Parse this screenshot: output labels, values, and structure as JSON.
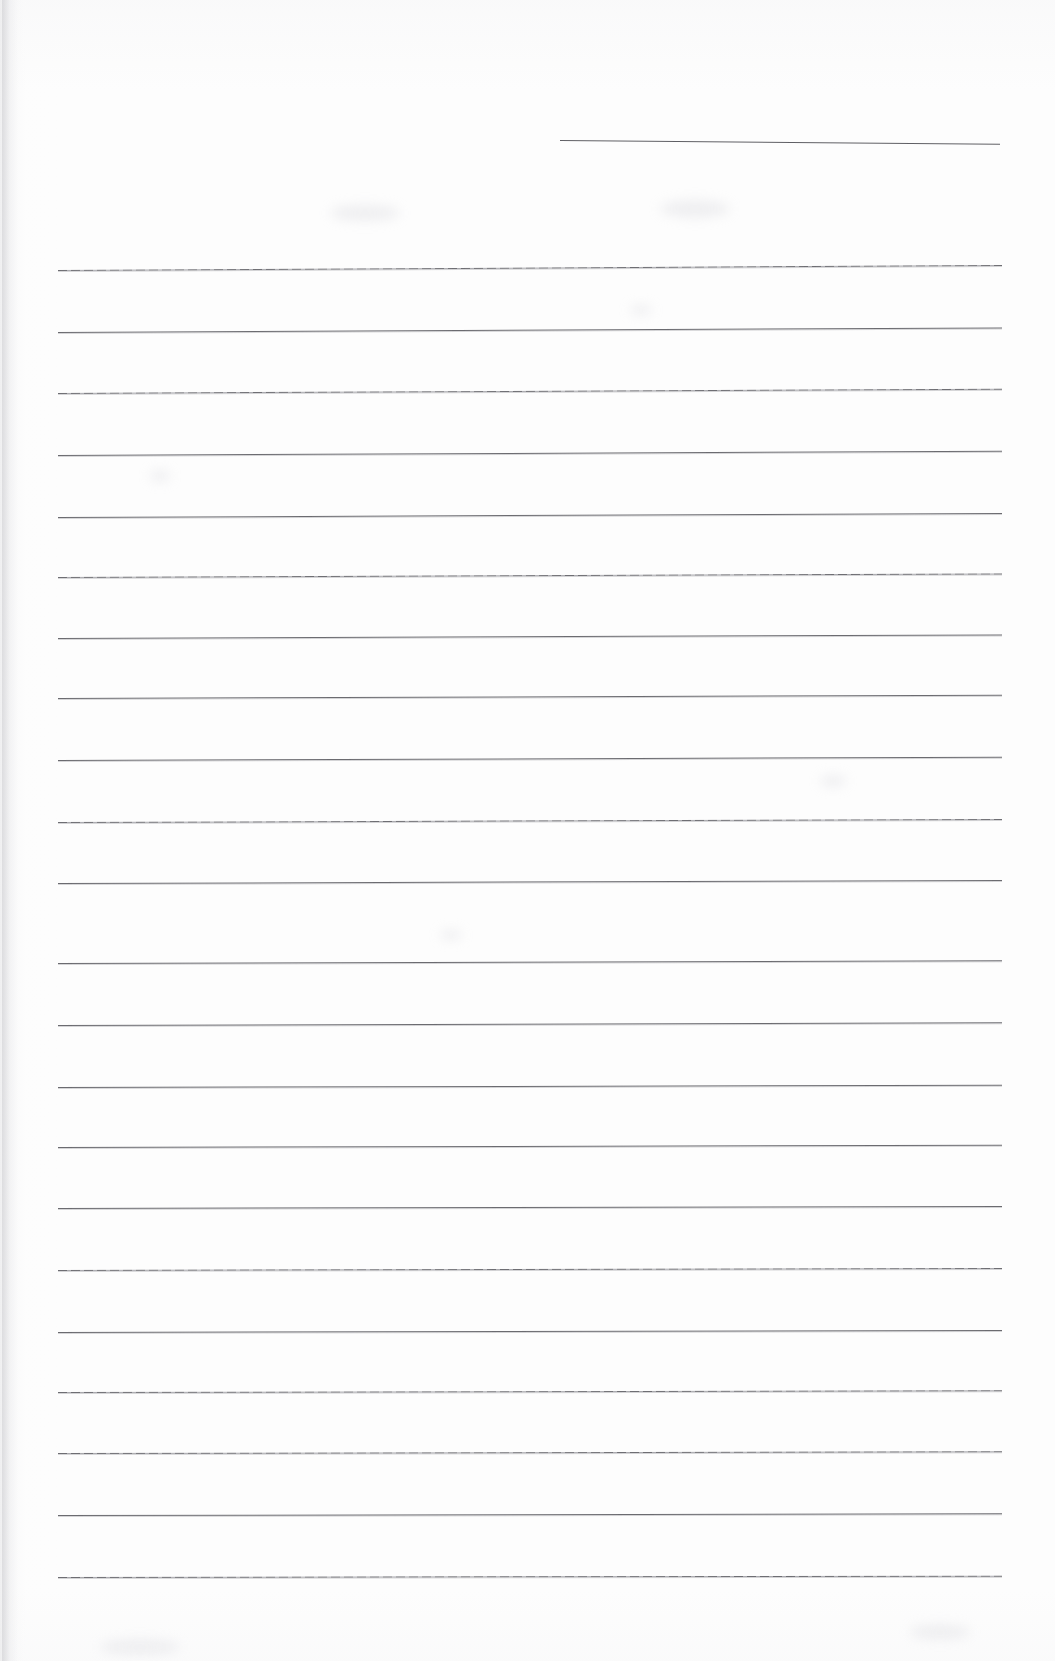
{
  "document": {
    "kind": "scanned-lined-page",
    "title": "Blank Ruled Page",
    "page_width": 1055,
    "page_height": 1661,
    "background_color": "#fdfdfd",
    "line_color": "#6b6b70",
    "text_content": "",
    "visible_text": []
  },
  "header_rule": {
    "name": "top-short-rule",
    "x": 560,
    "y": 140,
    "width": 440,
    "rotation_deg": 0.5,
    "color": "#5f5f64"
  },
  "ruling": {
    "left_margin": 58,
    "right_edge": 1002,
    "line_width": 944,
    "first_line_y": 270,
    "line_spacing": 62.2,
    "line_count": 22,
    "lines": [
      {
        "index": 1,
        "y": 270,
        "rotation_deg": -0.3,
        "style": "dotted-wear"
      },
      {
        "index": 2,
        "y": 332,
        "rotation_deg": -0.28,
        "style": "solid"
      },
      {
        "index": 3,
        "y": 393,
        "rotation_deg": -0.26,
        "style": "dotted-wear"
      },
      {
        "index": 4,
        "y": 455,
        "rotation_deg": -0.26,
        "style": "solid"
      },
      {
        "index": 5,
        "y": 517,
        "rotation_deg": -0.24,
        "style": "solid"
      },
      {
        "index": 6,
        "y": 577,
        "rotation_deg": -0.22,
        "style": "dotted-wear"
      },
      {
        "index": 7,
        "y": 638,
        "rotation_deg": -0.22,
        "style": "solid"
      },
      {
        "index": 8,
        "y": 698,
        "rotation_deg": -0.2,
        "style": "solid"
      },
      {
        "index": 9,
        "y": 760,
        "rotation_deg": -0.2,
        "style": "solid"
      },
      {
        "index": 10,
        "y": 822,
        "rotation_deg": -0.18,
        "style": "dotted-wear"
      },
      {
        "index": 11,
        "y": 883,
        "rotation_deg": -0.18,
        "style": "solid"
      },
      {
        "index": 12,
        "y": 963,
        "rotation_deg": -0.16,
        "style": "solid"
      },
      {
        "index": 13,
        "y": 1025,
        "rotation_deg": -0.16,
        "style": "solid"
      },
      {
        "index": 14,
        "y": 1087,
        "rotation_deg": -0.14,
        "style": "solid"
      },
      {
        "index": 15,
        "y": 1147,
        "rotation_deg": -0.14,
        "style": "solid"
      },
      {
        "index": 16,
        "y": 1208,
        "rotation_deg": -0.12,
        "style": "solid"
      },
      {
        "index": 17,
        "y": 1270,
        "rotation_deg": -0.12,
        "style": "dotted-wear"
      },
      {
        "index": 18,
        "y": 1332,
        "rotation_deg": -0.12,
        "style": "solid"
      },
      {
        "index": 19,
        "y": 1392,
        "rotation_deg": -0.1,
        "style": "dotted-wear"
      },
      {
        "index": 20,
        "y": 1453,
        "rotation_deg": -0.1,
        "style": "dotted-wear"
      },
      {
        "index": 21,
        "y": 1515,
        "rotation_deg": -0.1,
        "style": "solid"
      },
      {
        "index": 22,
        "y": 1577,
        "rotation_deg": -0.08,
        "style": "dotted-wear"
      }
    ]
  },
  "scan_artifacts": {
    "left_edge_shadow": true,
    "smudges": [
      {
        "x": 330,
        "y": 205,
        "w": 70,
        "h": 16
      },
      {
        "x": 660,
        "y": 200,
        "w": 70,
        "h": 18
      },
      {
        "x": 150,
        "y": 470,
        "w": 20,
        "h": 12
      },
      {
        "x": 440,
        "y": 930,
        "w": 22,
        "h": 10
      },
      {
        "x": 820,
        "y": 775,
        "w": 26,
        "h": 12
      },
      {
        "x": 630,
        "y": 305,
        "w": 22,
        "h": 10
      },
      {
        "x": 910,
        "y": 1625,
        "w": 60,
        "h": 14
      },
      {
        "x": 100,
        "y": 1640,
        "w": 80,
        "h": 14
      }
    ]
  }
}
